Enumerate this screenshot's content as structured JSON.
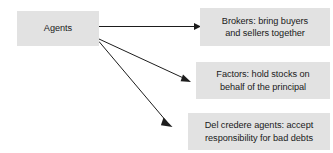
{
  "diagram": {
    "background_color": "#ffffff",
    "node_fill_color": "#e2e2e2",
    "text_color": "#1a1a1a",
    "arrow_color": "#1d1d1d",
    "source_node": {
      "id": "agents",
      "label": "Agents"
    },
    "target_nodes": [
      {
        "id": "brokers",
        "label": "Brokers: bring buyers and sellers together",
        "line1": "Brokers: bring buyers",
        "line2": "and sellers together"
      },
      {
        "id": "factors",
        "label": "Factors: hold stocks on behalf of the principal",
        "line1": "Factors: hold stocks on",
        "line2": "behalf of the principal"
      },
      {
        "id": "del-credere-agents",
        "label": "Del credere agents: accept responsibility for bad debts",
        "line1": "Del credere agents: accept",
        "line2": "responsibility for bad debts"
      }
    ],
    "edges": [
      {
        "from": "agents",
        "to": "brokers"
      },
      {
        "from": "agents",
        "to": "factors"
      },
      {
        "from": "agents",
        "to": "del-credere-agents"
      }
    ]
  }
}
